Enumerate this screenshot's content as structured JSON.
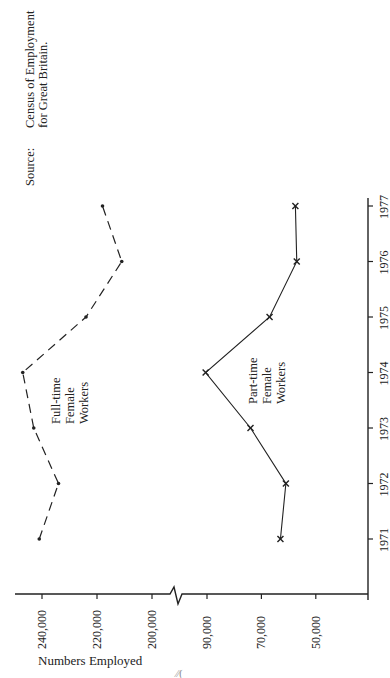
{
  "source": {
    "label": "Source:",
    "line1": "Census of Employment",
    "line2": "for Great Britain."
  },
  "axes": {
    "value_axis_title": "Numbers Employed",
    "value_ticks_upper": [
      "240,000",
      "220,000",
      "200,000"
    ],
    "value_ticks_lower": [
      "90,000",
      "70,000",
      "50,000"
    ],
    "year_ticks": [
      "1971",
      "1972",
      "1973",
      "1974",
      "1975",
      "1976",
      "1977"
    ]
  },
  "labels": {
    "full_time": [
      "Full-time",
      "Female",
      "Workers"
    ],
    "part_time": [
      "Part-time",
      "Female",
      "Workers"
    ]
  },
  "page_mark": "⁄⁄(",
  "chart_data": {
    "type": "line",
    "orientation": "rotated 90° — years on vertical axis (right), values on horizontal axis (bottom)",
    "title": "",
    "xlabel": "Year",
    "ylabel": "Numbers Employed",
    "x": [
      1971,
      1972,
      1973,
      1974,
      1975,
      1976,
      1977
    ],
    "series": [
      {
        "name": "Full-time Female Workers",
        "style": "dashed, dot markers",
        "values": [
          241000,
          234000,
          243000,
          247000,
          224000,
          211000,
          218000
        ]
      },
      {
        "name": "Part-time Female Workers",
        "style": "solid, cross markers",
        "values": [
          63000,
          61000,
          74000,
          90500,
          67000,
          57000,
          57500
        ]
      }
    ],
    "value_axis_ticks": [
      240000,
      220000,
      200000,
      90000,
      70000,
      50000
    ],
    "axis_break": "between 200,000 and 90,000",
    "ylim_upper_segment": [
      195000,
      250000
    ],
    "ylim_lower_segment": [
      43000,
      95000
    ],
    "grid": false,
    "legend": "inline labels next to each line",
    "annotations": [
      "Source: Census of Employment for Great Britain."
    ]
  }
}
